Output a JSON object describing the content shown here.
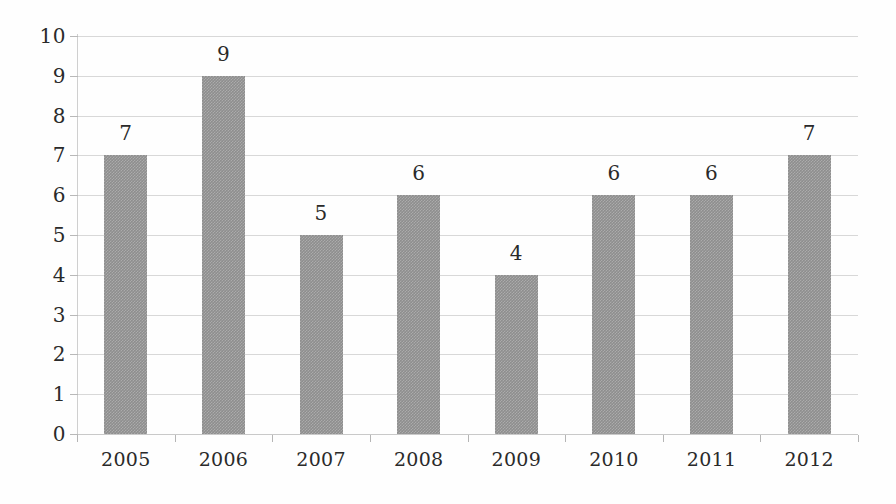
{
  "chart_data": {
    "type": "bar",
    "title": "",
    "subtitle": "",
    "xlabel": "",
    "ylabel": "",
    "categories": [
      "2005",
      "2006",
      "2007",
      "2008",
      "2009",
      "2010",
      "2011",
      "2012"
    ],
    "values": [
      7,
      9,
      5,
      6,
      4,
      6,
      6,
      7
    ],
    "data_labels": [
      "7",
      "9",
      "5",
      "6",
      "4",
      "6",
      "6",
      "7"
    ],
    "ylim": [
      0,
      10
    ],
    "y_ticks": [
      "0",
      "1",
      "2",
      "3",
      "4",
      "5",
      "6",
      "7",
      "8",
      "9",
      "10"
    ],
    "grid": true,
    "grid_axis": "y",
    "legend": false,
    "legend_position": "none",
    "bar_color": "#8e8e8e",
    "grid_color": "#d8d8d8",
    "axis_color": "#b5b5b5",
    "text_color": "#2a2a2a",
    "background_color": "#fefefe"
  }
}
